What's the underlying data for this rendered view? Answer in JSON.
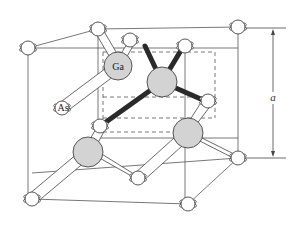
{
  "figure": {
    "labels": {
      "ga": "Ga",
      "as": "As",
      "lattice_constant": "a"
    },
    "colors": {
      "background": "#ffffff",
      "ga_atom": "#d3d3d3",
      "as_atom": "#ffffff",
      "outline": "#444444",
      "tetrahedral_bond": "#2a2a2a",
      "cube_edge": "#555555"
    },
    "atoms": {
      "as": [
        {
          "x": 28,
          "y": 48
        },
        {
          "x": 98,
          "y": 29
        },
        {
          "x": 130,
          "y": 40
        },
        {
          "x": 185,
          "y": 46
        },
        {
          "x": 238,
          "y": 27
        },
        {
          "x": 62,
          "y": 108
        },
        {
          "x": 100,
          "y": 126
        },
        {
          "x": 208,
          "y": 101
        },
        {
          "x": 32,
          "y": 199
        },
        {
          "x": 138,
          "y": 178
        },
        {
          "x": 238,
          "y": 158
        },
        {
          "x": 188,
          "y": 204
        }
      ],
      "ga": [
        {
          "x": 118,
          "y": 66,
          "label": true
        },
        {
          "x": 162,
          "y": 82
        },
        {
          "x": 88,
          "y": 152
        },
        {
          "x": 188,
          "y": 133
        }
      ]
    }
  }
}
